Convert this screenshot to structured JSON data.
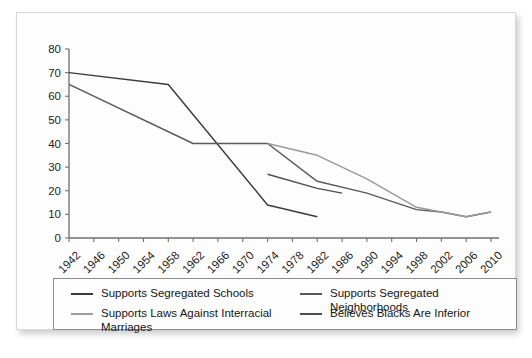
{
  "card": {
    "background_color": "#fdfdfd",
    "border_color": "#d7d7d7"
  },
  "chart_data": {
    "type": "line",
    "title": "",
    "subtitle": "",
    "xlabel": "",
    "ylabel": "",
    "xlim": [
      1942,
      2010
    ],
    "ylim": [
      0,
      80
    ],
    "grid": false,
    "legend_position": "bottom",
    "x": [
      1942,
      1946,
      1950,
      1954,
      1958,
      1962,
      1966,
      1970,
      1974,
      1978,
      1982,
      1986,
      1990,
      1994,
      1998,
      2002,
      2006,
      2010
    ],
    "tick_labels": [
      "1942",
      "1946",
      "1950",
      "1954",
      "1958",
      "1962",
      "1966",
      "1970",
      "1974",
      "1978",
      "1982",
      "1986",
      "1990",
      "1994",
      "1998",
      "2002",
      "2006",
      "2010"
    ],
    "ytick_labels": [
      "0",
      "10",
      "20",
      "30",
      "40",
      "50",
      "60",
      "70",
      "80"
    ],
    "yticks": [
      0,
      10,
      20,
      30,
      40,
      50,
      60,
      70,
      80
    ],
    "series": [
      {
        "name": "Supports Segregated Schools",
        "color": "#3a3a3a",
        "points": [
          {
            "x": 1942,
            "y": 70
          },
          {
            "x": 1958,
            "y": 65
          },
          {
            "x": 1974,
            "y": 14
          },
          {
            "x": 1982,
            "y": 9
          }
        ]
      },
      {
        "name": "Supports Segregated Neighborhoods",
        "color": "#5a5a5a",
        "points": [
          {
            "x": 1942,
            "y": 65
          },
          {
            "x": 1962,
            "y": 40
          },
          {
            "x": 1974,
            "y": 40
          },
          {
            "x": 1982,
            "y": 24
          },
          {
            "x": 1990,
            "y": 19
          },
          {
            "x": 1998,
            "y": 12
          },
          {
            "x": 2002,
            "y": 11
          },
          {
            "x": 2006,
            "y": 9
          },
          {
            "x": 2010,
            "y": 11
          }
        ]
      },
      {
        "name": "Supports Laws Against Interracial Marriages",
        "color": "#9a9a9a",
        "points": [
          {
            "x": 1974,
            "y": 40
          },
          {
            "x": 1982,
            "y": 35
          },
          {
            "x": 1990,
            "y": 25
          },
          {
            "x": 1998,
            "y": 13
          },
          {
            "x": 2002,
            "y": 11
          },
          {
            "x": 2006,
            "y": 9
          },
          {
            "x": 2010,
            "y": 11
          }
        ]
      },
      {
        "name": "Believes Blacks Are Inferior",
        "color": "#4e4e4e",
        "points": [
          {
            "x": 1974,
            "y": 27
          },
          {
            "x": 1982,
            "y": 21
          },
          {
            "x": 1986,
            "y": 19
          }
        ]
      }
    ]
  },
  "legend": {
    "entries": [
      {
        "label": "Supports Segregated Schools",
        "color": "#3a3a3a"
      },
      {
        "label": "Supports Laws Against Interracial Marriages",
        "color": "#9a9a9a"
      },
      {
        "label": "Supports Segregated Neighborhoods",
        "color": "#5a5a5a"
      },
      {
        "label": "Believes Blacks Are Inferior",
        "color": "#4e4e4e"
      }
    ]
  }
}
